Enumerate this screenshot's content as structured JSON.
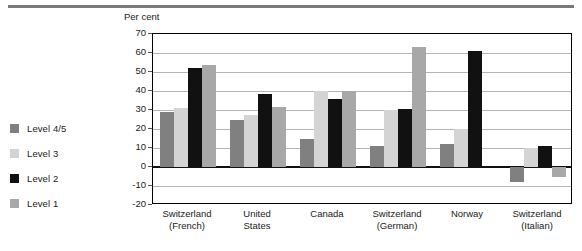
{
  "chart_data": {
    "type": "bar",
    "title": "",
    "subtitle": "",
    "ylabel": "Per cent",
    "xlabel": "",
    "ylim": [
      -20,
      70
    ],
    "ytick_step": 10,
    "yticks": [
      70,
      60,
      50,
      40,
      30,
      20,
      10,
      0,
      -10,
      -20
    ],
    "grid": true,
    "legend_position": "left",
    "categories": [
      "Switzerland (French)",
      "United States",
      "Canada",
      "Switzerland (German)",
      "Norway",
      "Switzerland (Italian)"
    ],
    "category_lines": [
      [
        "Switzerland",
        "(French)"
      ],
      [
        "United",
        "States"
      ],
      [
        "Canada",
        ""
      ],
      [
        "Switzerland",
        "(German)"
      ],
      [
        "Norway",
        ""
      ],
      [
        "Switzerland",
        "(Italian)"
      ]
    ],
    "series": [
      {
        "name": "Level 4/5",
        "color": "#808080",
        "values": [
          29,
          24.5,
          15,
          11,
          12,
          -8
        ]
      },
      {
        "name": "Level 3",
        "color": "#d4d4d4",
        "values": [
          31,
          27.5,
          40,
          30,
          20,
          10
        ]
      },
      {
        "name": "Level 2",
        "color": "#111111",
        "values": [
          52,
          38.5,
          36,
          30.5,
          61,
          11
        ]
      },
      {
        "name": "Level 1",
        "color": "#a8a8a8",
        "values": [
          53.5,
          31.5,
          40,
          63,
          0,
          -5
        ]
      }
    ]
  },
  "legend": {
    "items": [
      {
        "label": "Level 4/5",
        "color": "#808080"
      },
      {
        "label": "Level 3",
        "color": "#d4d4d4"
      },
      {
        "label": "Level 2",
        "color": "#111111"
      },
      {
        "label": "Level 1",
        "color": "#a8a8a8"
      }
    ]
  },
  "axis": {
    "y_title": "Per cent"
  }
}
